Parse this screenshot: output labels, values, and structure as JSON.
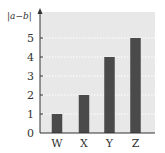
{
  "chart_data": {
    "type": "bar",
    "title": "",
    "xlabel": "",
    "ylabel": "|a−b|",
    "categories": [
      "W",
      "X",
      "Y",
      "Z"
    ],
    "values": [
      1,
      2,
      4,
      5
    ],
    "ylim": [
      0,
      5.8
    ],
    "yticks": [
      0,
      1,
      2,
      3,
      4,
      5
    ],
    "grid": true,
    "grid_style": "dotted horizontal",
    "legend": null,
    "colors": {
      "bar": "#4a4a4a",
      "plot_background": "#e8e8e8",
      "grid": "#ffffff",
      "axis": "#333333"
    }
  }
}
